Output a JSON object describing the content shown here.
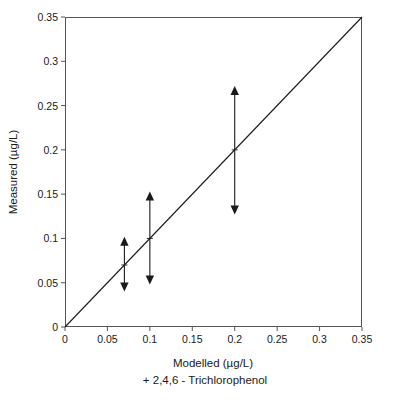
{
  "chart_data": {
    "type": "scatter",
    "title": "",
    "xlabel": "Modelled (µg/L)",
    "ylabel": "Measured (µg/L)",
    "caption": "+ 2,4,6 - Trichlorophenol",
    "xlim": [
      0,
      0.35
    ],
    "ylim": [
      0,
      0.35
    ],
    "xticks": [
      0,
      0.05,
      0.1,
      0.15,
      0.2,
      0.25,
      0.3,
      0.35
    ],
    "yticks": [
      0,
      0.05,
      0.1,
      0.15,
      0.2,
      0.25,
      0.3,
      0.35
    ],
    "xtick_labels": [
      "0",
      "0.05",
      "0.1",
      "0.15",
      "0.2",
      "0.25",
      "0.3",
      "0.35"
    ],
    "ytick_labels": [
      "0",
      "0.05",
      "0.1",
      "0.15",
      "0.2",
      "0.25",
      "0.3",
      "0.35"
    ],
    "grid": false,
    "legend": null,
    "reference_line": {
      "name": "one-to-one-line",
      "from": [
        0,
        0
      ],
      "to": [
        0.35,
        0.35
      ],
      "style": "solid",
      "color": "#1a1a1a"
    },
    "series": [
      {
        "name": "Measured vs Modelled (range bars)",
        "marker": "double-headed-vertical-arrow",
        "color": "#1a1a1a",
        "points": [
          {
            "x": 0.07,
            "y": 0.07,
            "low": 0.04,
            "high": 0.102
          },
          {
            "x": 0.1,
            "y": 0.1,
            "low": 0.048,
            "high": 0.153
          },
          {
            "x": 0.2,
            "y": 0.2,
            "low": 0.127,
            "high": 0.272
          }
        ]
      }
    ]
  },
  "axis_title_x": "Modelled (µg/L)",
  "axis_title_y": "Measured (µg/L)",
  "caption": "+ 2,4,6 - Trichlorophenol",
  "colors": {
    "ink": "#1a1a1a",
    "frame": "#555555",
    "background": "#ffffff"
  }
}
